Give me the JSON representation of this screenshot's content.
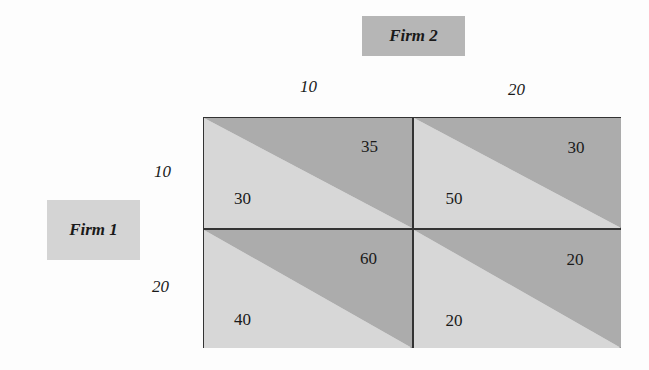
{
  "players": {
    "column_player": "Firm 2",
    "row_player": "Firm 1"
  },
  "column_strategies": [
    "10",
    "20"
  ],
  "row_strategies": [
    "10",
    "20"
  ],
  "payoffs": [
    [
      {
        "firm1": "30",
        "firm2": "35"
      },
      {
        "firm1": "50",
        "firm2": "30"
      }
    ],
    [
      {
        "firm1": "40",
        "firm2": "60"
      },
      {
        "firm1": "20",
        "firm2": "20"
      }
    ]
  ],
  "colors": {
    "dark_triangle": "#acacac",
    "light_triangle": "#d7d7d7",
    "firm2_box": "#b6b6b6",
    "firm1_box": "#d4d4d4"
  }
}
